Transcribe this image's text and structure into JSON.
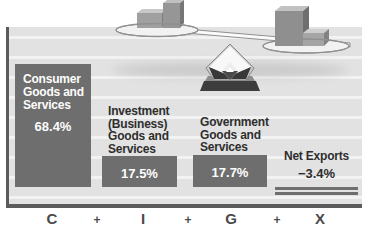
{
  "figure": {
    "description_colors": {
      "panel_background": "#e2e2e2",
      "gridline": "#f2f2f2",
      "bar_fill": "#6e6e6e",
      "bar_value_text": "#fdfdfd",
      "label_text": "#2e2e2e",
      "axis_frame": "#5b5b5b"
    }
  },
  "chart_data": {
    "type": "bar",
    "categories": [
      "C",
      "I",
      "G",
      "X"
    ],
    "values": [
      68.4,
      17.5,
      17.7,
      -3.4
    ],
    "series_labels": [
      "Consumer Goods and Services",
      "Investment (Business) Goods and Services",
      "Government Goods and Services",
      "Net Exports"
    ],
    "value_labels": [
      "68.4%",
      "17.5%",
      "17.7%",
      "−3.4%"
    ],
    "title": "",
    "xlabel": "",
    "ylabel": "",
    "grid": "horizontal",
    "legend": "none"
  },
  "bars": [
    {
      "label": "Consumer\nGoods and\nServices",
      "value": "68.4%"
    },
    {
      "label": "Investment\n(Business)\nGoods and\nServices",
      "value": "17.5%"
    },
    {
      "label": "Government\nGoods and\nServices",
      "value": "17.7%"
    },
    {
      "label": "Net Exports",
      "value": "−3.4%"
    }
  ],
  "equation": [
    "C",
    "+",
    "I",
    "+",
    "G",
    "+",
    "X"
  ]
}
